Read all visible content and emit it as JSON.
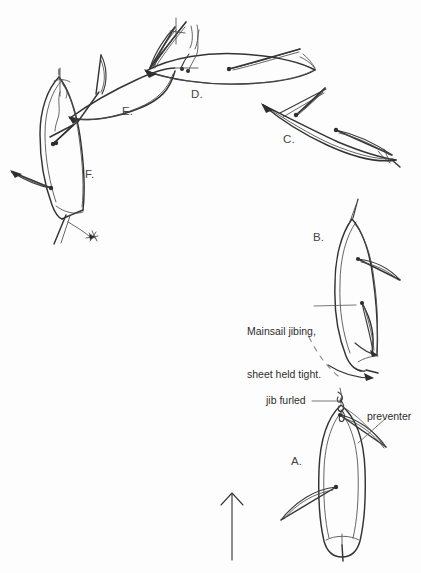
{
  "figure": {
    "kind": "hand-drawn nautical sketch",
    "background_color": "#fdfdfd",
    "ink_color": "#3a3a3a",
    "width": 421,
    "height": 573
  },
  "stage_labels": [
    {
      "id": "a",
      "text": "A.",
      "x": 291,
      "y": 462
    },
    {
      "id": "b",
      "text": "B.",
      "x": 313,
      "y": 238
    },
    {
      "id": "c",
      "text": "C.",
      "x": 283,
      "y": 140
    },
    {
      "id": "d",
      "text": "D.",
      "x": 191,
      "y": 95
    },
    {
      "id": "e",
      "text": "E.",
      "x": 122,
      "y": 112
    },
    {
      "id": "f",
      "text": "F.",
      "x": 85,
      "y": 175
    }
  ],
  "callouts": [
    {
      "id": "mainsail-jibing",
      "line1": "Mainsail jibing,",
      "line2": "sheet held tight.",
      "x": 247,
      "y": 302
    },
    {
      "id": "jib-furled",
      "line1": "jib furled",
      "x": 266,
      "y": 394
    },
    {
      "id": "preventer",
      "line1": "preventer",
      "x": 367,
      "y": 410
    }
  ],
  "wind_arrow": {
    "name": "wind-direction-arrow",
    "direction": "up",
    "x": 232,
    "y_top": 492,
    "y_bottom": 560
  },
  "boats": [
    {
      "id": "a",
      "label": "A.",
      "description": "boat sailing downwind, bow up, jib furled, preventer rigged, boom out to port"
    },
    {
      "id": "b",
      "label": "B.",
      "description": "boat turning, mainsail jibing with sheet held tight, boom swinging across"
    },
    {
      "id": "c",
      "label": "C.",
      "description": "boat heading right and down on new tack, sails set to starboard"
    },
    {
      "id": "d",
      "label": "D.",
      "description": "boat broad reaching toward the right, sails eased"
    },
    {
      "id": "e",
      "label": "E.",
      "description": "boat turning up through the top of the arc"
    },
    {
      "id": "f",
      "label": "F.",
      "description": "boat back on course heading down, sails set to port"
    }
  ]
}
